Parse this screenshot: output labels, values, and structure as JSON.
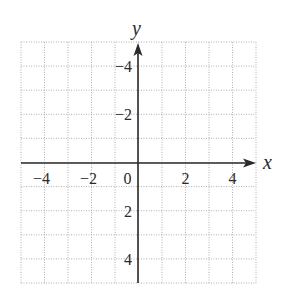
{
  "chart_data": {
    "type": "scatter",
    "title": "",
    "xlabel": "x",
    "ylabel": "y",
    "xlim": [
      -5,
      5
    ],
    "ylim": [
      -5,
      5
    ],
    "grid": true,
    "grid_style": "dotted",
    "grid_step": 1,
    "x_ticks": [
      -4,
      -2,
      0,
      2,
      4
    ],
    "y_ticks": [
      -4,
      -2,
      2,
      4
    ],
    "x_tick_labels": [
      "−4",
      "−2",
      "0",
      "2",
      "4"
    ],
    "y_tick_labels": [
      "4",
      "2",
      "−2",
      "−4"
    ],
    "series": [],
    "legend": null
  },
  "colors": {
    "axis": "#2a2a2a",
    "grid": "#b0b0b0",
    "text": "#2a2a2a"
  }
}
